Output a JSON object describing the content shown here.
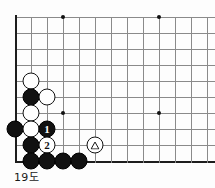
{
  "diagram": {
    "type": "go-board-diagram",
    "caption": "19도",
    "game": "go",
    "view": "bottom-left-corner",
    "board_size": 19,
    "grid": {
      "columns": 12,
      "rows": 9,
      "spacing_px": 16,
      "origin_x": 15,
      "origin_y": 17,
      "left_edge": true,
      "bottom_edge": true,
      "top_edge": false,
      "right_edge": false
    },
    "star_points": [
      {
        "col": 3,
        "row": 0
      },
      {
        "col": 9,
        "row": 0
      },
      {
        "col": 3,
        "row": 6
      },
      {
        "col": 9,
        "row": 6
      }
    ],
    "stones": [
      {
        "id": "w-a",
        "color": "white",
        "col": 1,
        "row": 4,
        "label": "",
        "mark": ""
      },
      {
        "id": "b-a",
        "color": "black",
        "col": 1,
        "row": 5,
        "label": "",
        "mark": ""
      },
      {
        "id": "w-b",
        "color": "white",
        "col": 2,
        "row": 5,
        "label": "",
        "mark": ""
      },
      {
        "id": "w-c",
        "color": "white",
        "col": 1,
        "row": 6,
        "label": "",
        "mark": ""
      },
      {
        "id": "b-b",
        "color": "black",
        "col": 0,
        "row": 7,
        "label": "",
        "mark": ""
      },
      {
        "id": "w-d",
        "color": "white",
        "col": 1,
        "row": 7,
        "label": "",
        "mark": ""
      },
      {
        "id": "move-1",
        "color": "black",
        "col": 2,
        "row": 7,
        "label": "1",
        "mark": ""
      },
      {
        "id": "b-c",
        "color": "black",
        "col": 1,
        "row": 8,
        "label": "",
        "mark": ""
      },
      {
        "id": "move-2",
        "color": "white",
        "col": 2,
        "row": 8,
        "label": "2",
        "mark": ""
      },
      {
        "id": "w-triangle",
        "color": "white",
        "col": 5,
        "row": 8,
        "label": "",
        "mark": "triangle"
      },
      {
        "id": "b-d",
        "color": "black",
        "col": 1,
        "row": 9,
        "label": "",
        "mark": ""
      },
      {
        "id": "b-e",
        "color": "black",
        "col": 2,
        "row": 9,
        "label": "",
        "mark": ""
      },
      {
        "id": "b-f",
        "color": "black",
        "col": 3,
        "row": 9,
        "label": "",
        "mark": ""
      },
      {
        "id": "b-g",
        "color": "black",
        "col": 4,
        "row": 9,
        "label": "",
        "mark": ""
      }
    ],
    "moves": [
      {
        "number": "1",
        "color": "black"
      },
      {
        "number": "2",
        "color": "white"
      }
    ],
    "colors": {
      "black_stone": "#111111",
      "white_stone": "#ffffff",
      "stone_outline": "#111111",
      "grid_line": "#8a8a8a",
      "board_edge": "#1d1d1d",
      "background": "#fdfdfd",
      "caption_text": "#1a1a1a"
    }
  }
}
